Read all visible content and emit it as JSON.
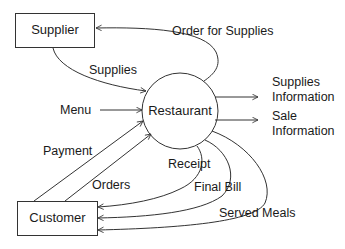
{
  "diagram": {
    "type": "data-flow-diagram (context level)",
    "colors": {
      "stroke": "#333333",
      "text": "#1a1a1a",
      "background": "#ffffff"
    },
    "nodes": {
      "supplier": {
        "label": "Supplier",
        "shape": "rectangle"
      },
      "restaurant": {
        "label": "Restaurant",
        "shape": "circle"
      },
      "customer": {
        "label": "Customer",
        "shape": "rectangle"
      }
    },
    "flows": {
      "order_for_supplies": {
        "label": "Order for Supplies",
        "from": "Restaurant",
        "to": "Supplier"
      },
      "supplies": {
        "label": "Supplies",
        "from": "Supplier",
        "to": "Restaurant"
      },
      "menu": {
        "label": "Menu",
        "from": "external",
        "to": "Restaurant"
      },
      "supplies_information": {
        "line1": "Supplies",
        "line2": "Information",
        "from": "Restaurant",
        "to": "external"
      },
      "sale_information": {
        "line1": "Sale",
        "line2": "Information",
        "from": "Restaurant",
        "to": "external"
      },
      "payment": {
        "label": "Payment",
        "from": "Customer",
        "to": "Restaurant"
      },
      "orders": {
        "label": "Orders",
        "from": "Customer",
        "to": "Restaurant"
      },
      "receipt": {
        "label": "Receipt",
        "from": "Restaurant",
        "to": "Customer"
      },
      "final_bill": {
        "label": "Final Bill",
        "from": "Restaurant",
        "to": "Customer"
      },
      "served_meals": {
        "label": "Served Meals",
        "from": "Restaurant",
        "to": "Customer"
      }
    }
  }
}
